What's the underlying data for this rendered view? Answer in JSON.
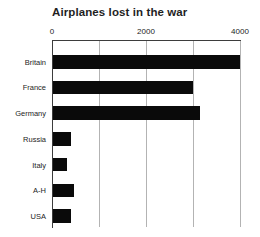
{
  "chart_data": {
    "type": "bar",
    "orientation": "horizontal",
    "title": "Airplanes lost in the war",
    "categories": [
      "Britain",
      "France",
      "Germany",
      "Russia",
      "Italy",
      "A-H",
      "USA"
    ],
    "values": [
      4000,
      3000,
      3150,
      380,
      300,
      450,
      380
    ],
    "xlabel": "",
    "ylabel": "",
    "xlim": [
      0,
      4000
    ],
    "x_gridline_values": [
      1000,
      2000,
      3000,
      4000
    ],
    "x_tick_labels": [
      {
        "value": 0,
        "label": "0"
      },
      {
        "value": 2000,
        "label": "2000"
      },
      {
        "value": 4000,
        "label": "4000"
      }
    ],
    "grid": true,
    "legend": "none",
    "colors": {
      "bar": "#0a0a0a",
      "gridline": "#b3b3b3",
      "axis": "#3d3d3d",
      "text": "#242424",
      "background": "#ffffff"
    }
  }
}
